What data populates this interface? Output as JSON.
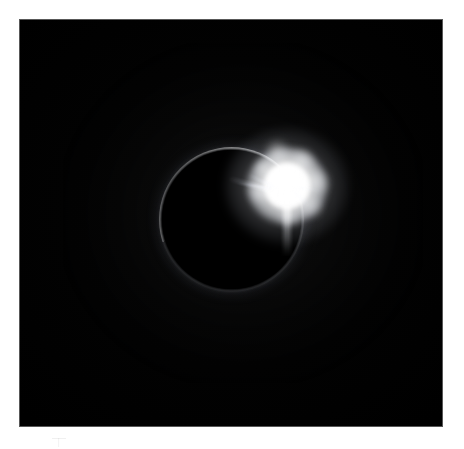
{
  "image": {
    "title": "Total solar eclipse — diamond ring",
    "subject": "solar-eclipse",
    "caption": "",
    "alt_text": "Photograph of a total solar eclipse showing the dark silhouette of the moon ringed by a faint corona, with a brilliant point of sunlight — the diamond ring — bursting from the upper-right limb."
  },
  "canvas": {
    "width": 464,
    "height": 449,
    "mount_color": "#ffffff",
    "plate_color": "#000000",
    "plate_border_color": "#585858",
    "plate": {
      "x": 20,
      "y": 20,
      "width": 422,
      "height": 406
    }
  },
  "scene": {
    "background_label": "night-sky",
    "background_color": "#000000",
    "corona_color": "#ffffff",
    "flare_color": "#ffffff"
  },
  "moon_disk": {
    "label": "moon-silhouette",
    "center_x": 230,
    "center_y": 219,
    "radius": 70,
    "color": "#000000"
  },
  "corona_ring": {
    "label": "corona-ring",
    "center_x": 230,
    "center_y": 219,
    "radius": 72,
    "thickness": 2,
    "brightest_side": "upper-right",
    "dimmest_side": "left"
  },
  "diamond_bead": {
    "label": "diamond-ring-bead",
    "center_x": 287,
    "center_y": 186,
    "core_diameter": 46,
    "halo_diameter": 120,
    "color": "#ffffff"
  },
  "flare_spikes": [
    {
      "label": "spike-upper-left-long",
      "angle_deg": 196,
      "length": 58,
      "width": 7
    },
    {
      "label": "spike-upper-left-short",
      "angle_deg": 205,
      "length": 40,
      "width": 5
    },
    {
      "label": "spike-upper-left-thin",
      "angle_deg": 188,
      "length": 46,
      "width": 4
    },
    {
      "label": "spike-right-faint",
      "angle_deg": 8,
      "length": 30,
      "width": 5
    },
    {
      "label": "spike-lower-right",
      "angle_deg": 42,
      "length": 26,
      "width": 5
    }
  ],
  "fringe_tufts": [
    {
      "label": "tuft-top",
      "dx": -10,
      "dy": -34,
      "size": 24
    },
    {
      "label": "tuft-top-right",
      "dx": 16,
      "dy": -26,
      "size": 22
    },
    {
      "label": "tuft-right",
      "dx": 30,
      "dy": -4,
      "size": 26
    },
    {
      "label": "tuft-lower-right",
      "dx": 24,
      "dy": 20,
      "size": 24
    },
    {
      "label": "tuft-bottom",
      "dx": 2,
      "dy": 30,
      "size": 22
    },
    {
      "label": "tuft-left",
      "dx": -28,
      "dy": 6,
      "size": 22
    },
    {
      "label": "tuft-upper-left",
      "dx": -24,
      "dy": -18,
      "size": 18
    }
  ],
  "mount_artifact": {
    "label": "mount-scuff-mark",
    "x": 52,
    "y": 438
  }
}
